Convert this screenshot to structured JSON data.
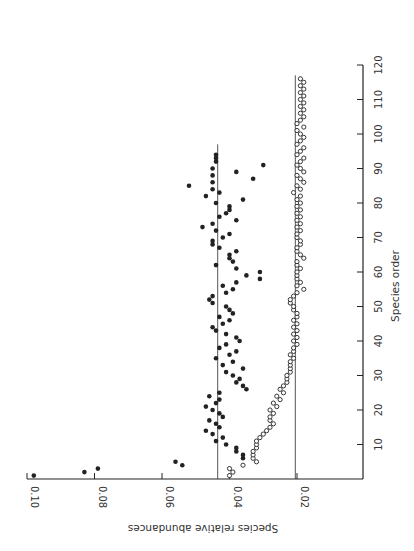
{
  "chart_data": {
    "type": "scatter",
    "title": "",
    "orientation": "rotated 90 degrees clockwise (species order axis drawn vertically at right, abundance axis drawn horizontally at bottom with decreasing values left-to-right)",
    "xlabel": "Species order",
    "ylabel": "Species relative abundances",
    "xlim": [
      0,
      120
    ],
    "ylim": [
      0,
      0.1
    ],
    "x_ticks": [
      10,
      20,
      30,
      40,
      50,
      60,
      70,
      80,
      90,
      100,
      110,
      120
    ],
    "x_tick_labels": [
      "10",
      "20",
      "30",
      "40",
      "50",
      "60",
      "70",
      "80",
      "90",
      "100",
      "110",
      "120"
    ],
    "y_ticks": [
      0.02,
      0.04,
      0.06,
      0.08,
      0.1
    ],
    "y_tick_labels": [
      "0.02",
      "0.04",
      "0.06",
      "0.08",
      "0.10"
    ],
    "grid": false,
    "legend": null,
    "reference_lines": [
      {
        "series": "filled",
        "value": 0.0435,
        "x_range": [
          0,
          97
        ]
      },
      {
        "series": "open",
        "value": 0.0205,
        "x_range": [
          0,
          117
        ]
      }
    ],
    "series": [
      {
        "name": "filled",
        "marker": "filled-circle",
        "points": [
          [
            1,
            0.098
          ],
          [
            2,
            0.083
          ],
          [
            3,
            0.079
          ],
          [
            4,
            0.054
          ],
          [
            5,
            0.056
          ],
          [
            6,
            0.036
          ],
          [
            7,
            0.036
          ],
          [
            8,
            0.038
          ],
          [
            9,
            0.038
          ],
          [
            10,
            0.041
          ],
          [
            11,
            0.044
          ],
          [
            12,
            0.042
          ],
          [
            13,
            0.045
          ],
          [
            14,
            0.047
          ],
          [
            15,
            0.043
          ],
          [
            16,
            0.044
          ],
          [
            17,
            0.046
          ],
          [
            18,
            0.042
          ],
          [
            19,
            0.043
          ],
          [
            20,
            0.045
          ],
          [
            21,
            0.047
          ],
          [
            22,
            0.044
          ],
          [
            23,
            0.043
          ],
          [
            24,
            0.046
          ],
          [
            25,
            0.043
          ],
          [
            26,
            0.035
          ],
          [
            27,
            0.036
          ],
          [
            28,
            0.038
          ],
          [
            29,
            0.037
          ],
          [
            30,
            0.039
          ],
          [
            31,
            0.041
          ],
          [
            32,
            0.036
          ],
          [
            33,
            0.042
          ],
          [
            34,
            0.039
          ],
          [
            35,
            0.044
          ],
          [
            36,
            0.04
          ],
          [
            37,
            0.038
          ],
          [
            38,
            0.043
          ],
          [
            39,
            0.041
          ],
          [
            40,
            0.037
          ],
          [
            41,
            0.038
          ],
          [
            42,
            0.041
          ],
          [
            43,
            0.044
          ],
          [
            44,
            0.045
          ],
          [
            45,
            0.042
          ],
          [
            46,
            0.04
          ],
          [
            47,
            0.043
          ],
          [
            48,
            0.039
          ],
          [
            49,
            0.04
          ],
          [
            50,
            0.041
          ],
          [
            51,
            0.045
          ],
          [
            52,
            0.046
          ],
          [
            53,
            0.045
          ],
          [
            54,
            0.041
          ],
          [
            55,
            0.039
          ],
          [
            56,
            0.042
          ],
          [
            57,
            0.038
          ],
          [
            58,
            0.031
          ],
          [
            59,
            0.035
          ],
          [
            60,
            0.031
          ],
          [
            61,
            0.038
          ],
          [
            62,
            0.044
          ],
          [
            63,
            0.039
          ],
          [
            64,
            0.04
          ],
          [
            65,
            0.04
          ],
          [
            66,
            0.038
          ],
          [
            67,
            0.043
          ],
          [
            68,
            0.045
          ],
          [
            69,
            0.045
          ],
          [
            70,
            0.042
          ],
          [
            71,
            0.04
          ],
          [
            72,
            0.044
          ],
          [
            73,
            0.048
          ],
          [
            74,
            0.045
          ],
          [
            75,
            0.038
          ],
          [
            76,
            0.043
          ],
          [
            77,
            0.041
          ],
          [
            78,
            0.04
          ],
          [
            79,
            0.04
          ],
          [
            80,
            0.044
          ],
          [
            81,
            0.036
          ],
          [
            82,
            0.047
          ],
          [
            83,
            0.043
          ],
          [
            84,
            0.045
          ],
          [
            85,
            0.052
          ],
          [
            86,
            0.045
          ],
          [
            87,
            0.033
          ],
          [
            88,
            0.045
          ],
          [
            89,
            0.038
          ],
          [
            90,
            0.045
          ],
          [
            91,
            0.03
          ],
          [
            92,
            0.044
          ],
          [
            93,
            0.044
          ],
          [
            94,
            0.044
          ]
        ]
      },
      {
        "name": "open",
        "marker": "open-circle",
        "points": [
          [
            1,
            0.04
          ],
          [
            2,
            0.039
          ],
          [
            3,
            0.04
          ],
          [
            4,
            0.036
          ],
          [
            5,
            0.032
          ],
          [
            6,
            0.033
          ],
          [
            7,
            0.033
          ],
          [
            8,
            0.033
          ],
          [
            9,
            0.032
          ],
          [
            10,
            0.032
          ],
          [
            11,
            0.032
          ],
          [
            12,
            0.031
          ],
          [
            13,
            0.03
          ],
          [
            14,
            0.029
          ],
          [
            15,
            0.028
          ],
          [
            16,
            0.027
          ],
          [
            17,
            0.028
          ],
          [
            18,
            0.028
          ],
          [
            19,
            0.027
          ],
          [
            20,
            0.028
          ],
          [
            21,
            0.026
          ],
          [
            22,
            0.027
          ],
          [
            23,
            0.025
          ],
          [
            24,
            0.026
          ],
          [
            25,
            0.024
          ],
          [
            26,
            0.025
          ],
          [
            27,
            0.024
          ],
          [
            28,
            0.023
          ],
          [
            29,
            0.023
          ],
          [
            30,
            0.023
          ],
          [
            31,
            0.022
          ],
          [
            32,
            0.022
          ],
          [
            33,
            0.022
          ],
          [
            34,
            0.022
          ],
          [
            35,
            0.021
          ],
          [
            36,
            0.022
          ],
          [
            37,
            0.021
          ],
          [
            38,
            0.021
          ],
          [
            39,
            0.02
          ],
          [
            40,
            0.021
          ],
          [
            41,
            0.02
          ],
          [
            42,
            0.021
          ],
          [
            43,
            0.02
          ],
          [
            44,
            0.021
          ],
          [
            45,
            0.02
          ],
          [
            46,
            0.021
          ],
          [
            47,
            0.02
          ],
          [
            48,
            0.02
          ],
          [
            49,
            0.021
          ],
          [
            50,
            0.021
          ],
          [
            51,
            0.022
          ],
          [
            52,
            0.022
          ],
          [
            53,
            0.021
          ],
          [
            54,
            0.02
          ],
          [
            55,
            0.018
          ],
          [
            56,
            0.02
          ],
          [
            57,
            0.019
          ],
          [
            58,
            0.02
          ],
          [
            59,
            0.02
          ],
          [
            60,
            0.02
          ],
          [
            61,
            0.019
          ],
          [
            62,
            0.02
          ],
          [
            63,
            0.02
          ],
          [
            64,
            0.018
          ],
          [
            65,
            0.019
          ],
          [
            66,
            0.02
          ],
          [
            67,
            0.02
          ],
          [
            68,
            0.019
          ],
          [
            69,
            0.019
          ],
          [
            70,
            0.02
          ],
          [
            71,
            0.02
          ],
          [
            72,
            0.019
          ],
          [
            73,
            0.02
          ],
          [
            74,
            0.019
          ],
          [
            75,
            0.02
          ],
          [
            76,
            0.019
          ],
          [
            77,
            0.02
          ],
          [
            78,
            0.019
          ],
          [
            79,
            0.02
          ],
          [
            80,
            0.019
          ],
          [
            81,
            0.02
          ],
          [
            82,
            0.019
          ],
          [
            83,
            0.021
          ],
          [
            84,
            0.019
          ],
          [
            85,
            0.02
          ],
          [
            86,
            0.018
          ],
          [
            87,
            0.019
          ],
          [
            88,
            0.02
          ],
          [
            89,
            0.018
          ],
          [
            90,
            0.019
          ],
          [
            91,
            0.02
          ],
          [
            92,
            0.019
          ],
          [
            93,
            0.018
          ],
          [
            94,
            0.02
          ],
          [
            95,
            0.019
          ],
          [
            96,
            0.018
          ],
          [
            97,
            0.02
          ],
          [
            98,
            0.019
          ],
          [
            99,
            0.018
          ],
          [
            100,
            0.019
          ],
          [
            101,
            0.02
          ],
          [
            102,
            0.018
          ],
          [
            103,
            0.02
          ],
          [
            104,
            0.019
          ],
          [
            105,
            0.018
          ],
          [
            106,
            0.019
          ],
          [
            107,
            0.018
          ],
          [
            108,
            0.019
          ],
          [
            109,
            0.018
          ],
          [
            110,
            0.019
          ],
          [
            111,
            0.018
          ],
          [
            112,
            0.019
          ],
          [
            113,
            0.018
          ],
          [
            114,
            0.019
          ],
          [
            115,
            0.018
          ],
          [
            116,
            0.019
          ]
        ]
      }
    ]
  },
  "axes": {
    "species_label": "Species order",
    "abundance_label": "Species relative abundances"
  },
  "colors": {
    "ink": "#222222",
    "line": "#555555",
    "background": "#ffffff"
  }
}
